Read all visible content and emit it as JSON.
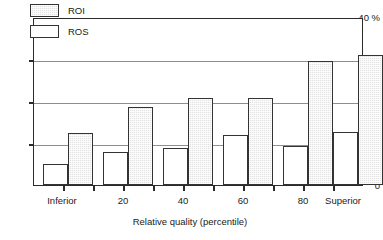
{
  "chart_data": {
    "type": "bar",
    "title": "",
    "subtitle": "",
    "xlabel": "Relative quality (percentile)",
    "ylabel": "",
    "y_unit_label": "40 %",
    "ylim": [
      0,
      40
    ],
    "yticks": [
      0,
      10,
      20,
      30,
      40
    ],
    "ytick_labels": [
      "0",
      "10",
      "20",
      "30",
      "40 %"
    ],
    "grid": "horizontal",
    "legend_position": "top-left-inside",
    "categories": [
      "Inferior",
      "",
      "",
      "",
      "",
      "Superior"
    ],
    "xtick_labels": [
      "Inferior",
      "20",
      "40",
      "60",
      "80",
      "Superior"
    ],
    "series": [
      {
        "name": "ROS",
        "fill": "white",
        "values": [
          5.0,
          8.0,
          9.0,
          12.0,
          9.5,
          12.7
        ]
      },
      {
        "name": "ROI",
        "fill": "stipple-gray",
        "values": [
          12.5,
          18.7,
          20.9,
          21.0,
          29.8,
          31.3
        ]
      }
    ],
    "colors": {
      "bar_outline": "#333333",
      "roi_fill": "#e2e2e2",
      "ros_fill": "#ffffff",
      "gridline": "#8e8e8e",
      "axis": "#2b2b2b",
      "text": "#1a1a1a"
    }
  },
  "legend": {
    "items": [
      {
        "label": "ROI",
        "style": "roi"
      },
      {
        "label": "ROS",
        "style": "ros"
      }
    ]
  }
}
